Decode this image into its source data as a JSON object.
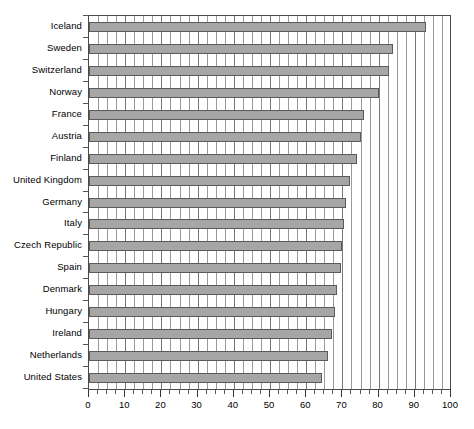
{
  "chart_data": {
    "type": "bar",
    "orientation": "horizontal",
    "title": "",
    "subtitle": "",
    "xlabel": "",
    "ylabel": "",
    "xlim": [
      0,
      100
    ],
    "ylim": null,
    "grid": true,
    "legend": null,
    "legend_position": "none",
    "x_major_tick_step": 10,
    "x_minor_tick_step": 2.5,
    "x_tick_labels": [
      "0",
      "10",
      "20",
      "30",
      "40",
      "50",
      "60",
      "70",
      "80",
      "90",
      "100"
    ],
    "x_tick_values": [
      0,
      10,
      20,
      30,
      40,
      50,
      60,
      70,
      80,
      90,
      100
    ],
    "categories": [
      "Iceland",
      "Sweden",
      "Switzerland",
      "Norway",
      "France",
      "Austria",
      "Finland",
      "United Kingdom",
      "Germany",
      "Italy",
      "Czech Republic",
      "Spain",
      "Denmark",
      "Hungary",
      "Ireland",
      "Netherlands",
      "United States"
    ],
    "values": [
      93,
      84,
      83,
      80,
      76,
      75,
      74,
      72,
      71,
      70.5,
      70,
      69.5,
      68.5,
      68,
      67,
      66,
      64.5
    ],
    "bar_color": "#a6a6a6",
    "bar_edge_color": "#5a5a5a",
    "grid_color": "#777777",
    "axis_color": "#4a4a4a",
    "text_color": "#000000"
  }
}
